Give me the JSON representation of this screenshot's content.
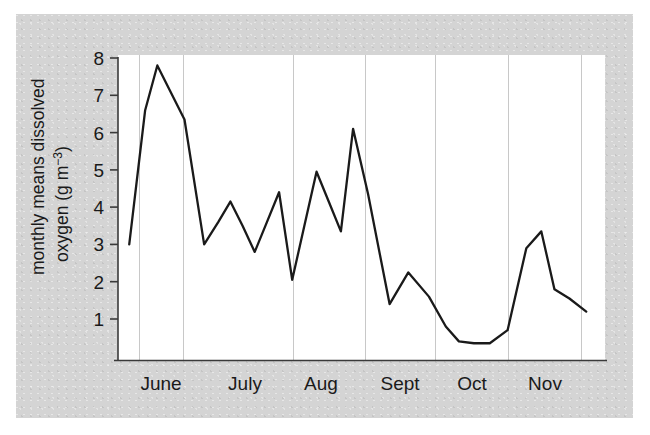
{
  "figure": {
    "background_color": "#d4d4d4",
    "plot_background_color": "#ffffff",
    "line_color": "#1a1a1a",
    "gridline_color": "#c8c8c8",
    "axis_color": "#3a3a3a",
    "text_color": "#1a1a1a"
  },
  "chart_data": {
    "type": "line",
    "title": "",
    "xlabel": "",
    "ylabel": "monthly means dissolved oxygen (g m-3)",
    "ylabel_parts": {
      "line1": "monthly means dissolved",
      "line2_main": "oxygen (g m",
      "line2_sup": "−3",
      "line2_tail": ")"
    },
    "xlim": [
      0,
      26
    ],
    "ylim": [
      0,
      8.35
    ],
    "yticks": [
      1,
      2,
      3,
      4,
      5,
      6,
      7,
      8
    ],
    "ytick_labels": [
      "1",
      "2",
      "3",
      "4",
      "5",
      "6",
      "7",
      "8"
    ],
    "grid": "vertical-only",
    "gridlines_x": [
      1,
      3,
      8,
      11.3,
      14.5,
      17.8,
      21.1
    ],
    "legend": "none",
    "categories": [
      "June",
      "July",
      "Aug",
      "Sept",
      "Oct",
      "Nov"
    ],
    "xtick_labels": [
      "June",
      "July",
      "Aug",
      "Sept",
      "Oct",
      "Nov"
    ],
    "xtick_positions": [
      2.0,
      5.85,
      9.35,
      12.6,
      16.0,
      19.3
    ],
    "series": [
      {
        "name": "monthly means dissolved oxygen",
        "x": [
          0.6,
          1.45,
          2.1,
          2.75,
          3.55,
          4.6,
          5.35,
          6.0,
          6.65,
          7.3,
          7.95,
          8.6,
          9.3,
          9.95,
          10.6,
          11.25,
          11.9,
          12.55,
          13.35,
          14.5,
          15.5,
          16.6,
          17.5,
          18.2,
          19.0,
          19.85,
          20.8,
          21.8,
          22.6
        ],
        "y": [
          3.0,
          6.6,
          7.8,
          7.15,
          6.35,
          3.0,
          3.6,
          4.15,
          3.5,
          2.8,
          3.6,
          4.4,
          2.05,
          3.5,
          4.95,
          4.15,
          3.35,
          6.1,
          4.35,
          1.4,
          2.25,
          1.6,
          0.8,
          0.4,
          0.35,
          0.35,
          0.7,
          2.9,
          3.35
        ],
        "y_tail": [
          1.8,
          1.55,
          1.2
        ],
        "x_tail": [
          23.3,
          24.1,
          25.0
        ]
      }
    ],
    "data_points": [
      {
        "x": 0.6,
        "y": 3.0
      },
      {
        "x": 1.45,
        "y": 6.6
      },
      {
        "x": 2.1,
        "y": 7.8
      },
      {
        "x": 2.75,
        "y": 7.15
      },
      {
        "x": 3.55,
        "y": 6.35
      },
      {
        "x": 4.6,
        "y": 3.0
      },
      {
        "x": 5.35,
        "y": 3.6
      },
      {
        "x": 6.0,
        "y": 4.15
      },
      {
        "x": 6.65,
        "y": 3.5
      },
      {
        "x": 7.3,
        "y": 2.8
      },
      {
        "x": 7.95,
        "y": 3.6
      },
      {
        "x": 8.6,
        "y": 4.4
      },
      {
        "x": 9.3,
        "y": 2.05
      },
      {
        "x": 9.95,
        "y": 3.5
      },
      {
        "x": 10.6,
        "y": 4.95
      },
      {
        "x": 11.25,
        "y": 4.15
      },
      {
        "x": 11.9,
        "y": 3.35
      },
      {
        "x": 12.55,
        "y": 6.1
      },
      {
        "x": 13.35,
        "y": 4.35
      },
      {
        "x": 14.5,
        "y": 1.4
      },
      {
        "x": 15.5,
        "y": 2.25
      },
      {
        "x": 16.6,
        "y": 1.6
      },
      {
        "x": 17.5,
        "y": 0.8
      },
      {
        "x": 18.2,
        "y": 0.4
      },
      {
        "x": 19.0,
        "y": 0.35
      },
      {
        "x": 19.85,
        "y": 0.35
      },
      {
        "x": 20.8,
        "y": 0.7
      },
      {
        "x": 21.8,
        "y": 2.9
      },
      {
        "x": 22.6,
        "y": 3.35
      },
      {
        "x": 23.3,
        "y": 1.8
      },
      {
        "x": 24.1,
        "y": 1.55
      },
      {
        "x": 25.0,
        "y": 1.2
      }
    ],
    "summary": {
      "maximum": 7.8,
      "minimum": 0.35,
      "first_value": 3.0,
      "last_value": 1.2
    }
  }
}
